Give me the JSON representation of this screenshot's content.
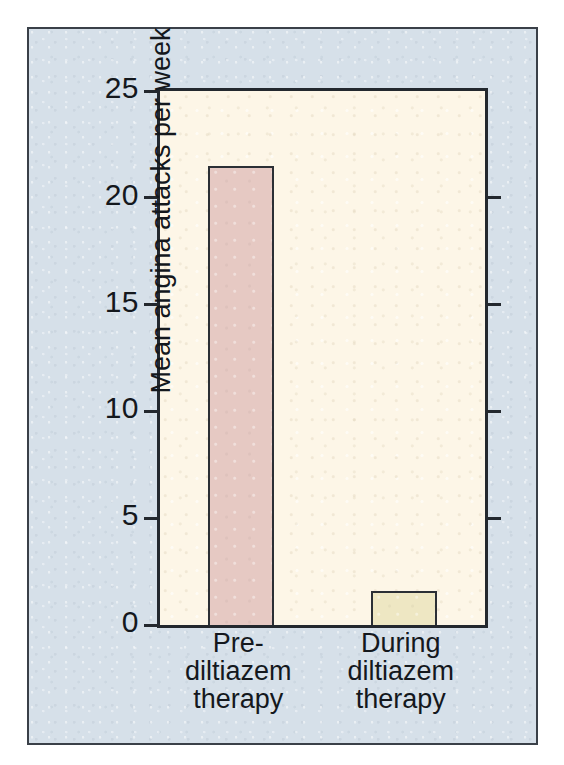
{
  "chart_data": {
    "type": "bar",
    "title": "",
    "xlabel": "",
    "ylabel": "Mean angina attacks per week",
    "categories": [
      "Pre-diltiazem therapy",
      "During diltiazem therapy"
    ],
    "category_lines": [
      [
        "Pre-",
        "diltiazem",
        "therapy"
      ],
      [
        "During",
        "diltiazem",
        "therapy"
      ]
    ],
    "values": [
      21.5,
      1.6
    ],
    "ylim": [
      0,
      25
    ],
    "yticks": [
      0,
      5,
      10,
      15,
      20,
      25
    ],
    "ytick_labels": [
      "0",
      "5",
      "10",
      "15",
      "20",
      "25"
    ],
    "grid": false,
    "legend": false,
    "bar_colors": [
      "#e6c9c3",
      "#eee7c3"
    ],
    "plot_background": "#fdf6e7",
    "panel_background": "#d6e0e9",
    "axis_color": "#23282e",
    "text_color": "#14181d"
  }
}
